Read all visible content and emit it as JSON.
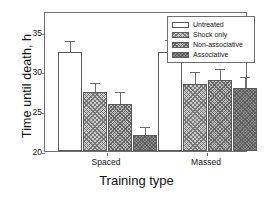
{
  "chart_data": {
    "type": "bar",
    "title": "",
    "xlabel": "Training type",
    "ylabel": "Time until death, h",
    "categories": [
      "Spaced",
      "Massed"
    ],
    "ylim": [
      20,
      37.7
    ],
    "yticks": [
      20,
      25,
      30,
      35
    ],
    "ytick_labels": [
      "20",
      "25",
      "30",
      "35"
    ],
    "grid": false,
    "legend_position": "top-right",
    "error_bars": "upper only (SEM)",
    "series": [
      {
        "name": "Untreated",
        "fill": "white",
        "color": "#ffffff",
        "values": [
          32.5,
          32.5
        ],
        "errors": [
          1.3,
          1.4
        ]
      },
      {
        "name": "Shock only",
        "fill": "light-crosshatch",
        "color": "#c9c9c9",
        "values": [
          27.5,
          28.5
        ],
        "errors": [
          1.0,
          1.4
        ]
      },
      {
        "name": "Non-associative",
        "fill": "medium-crosshatch",
        "color": "#bdbdbd",
        "values": [
          26.0,
          29.0
        ],
        "errors": [
          1.3,
          1.3
        ]
      },
      {
        "name": "Associative",
        "fill": "dark-solid",
        "color": "#8e8e8e",
        "values": [
          22.0,
          28.0
        ],
        "errors": [
          0.9,
          1.2
        ]
      }
    ]
  },
  "legend": {
    "items": [
      {
        "label": "Untreated"
      },
      {
        "label": "Shock only"
      },
      {
        "label": "Non-associative"
      },
      {
        "label": "Associative"
      }
    ]
  },
  "axes": {
    "y_title": "Time until death, h",
    "x_title": "Training type",
    "y_tick_0": "20",
    "y_tick_1": "25",
    "y_tick_2": "30",
    "y_tick_3": "35",
    "x_tick_0": "Spaced",
    "x_tick_1": "Massed"
  }
}
